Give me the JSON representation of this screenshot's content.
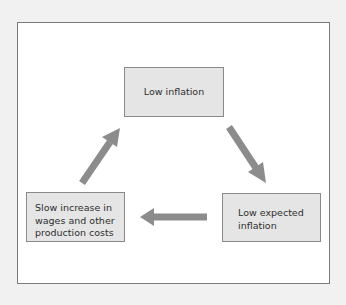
{
  "diagram": {
    "type": "cycle",
    "nodes": [
      {
        "id": "top",
        "lines": [
          "Low inflation"
        ]
      },
      {
        "id": "right",
        "lines": [
          "Low expected",
          "inflation"
        ]
      },
      {
        "id": "left",
        "lines": [
          "Slow increase in",
          "wages and other",
          "production costs"
        ]
      }
    ],
    "edges": [
      {
        "from": "top",
        "to": "right"
      },
      {
        "from": "right",
        "to": "left"
      },
      {
        "from": "left",
        "to": "top"
      }
    ],
    "colors": {
      "node_fill": "#e5e5e5",
      "node_border": "#8a8a8a",
      "arrow": "#8c8c8c",
      "text": "#2e2e2e"
    }
  }
}
